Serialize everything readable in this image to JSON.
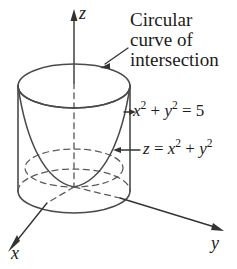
{
  "figure": {
    "type": "math-3d-diagram",
    "background_color": "#ffffff",
    "stroke_color": "#4a4a4a",
    "text_color": "#1b1b1b",
    "caption": {
      "line1": "Circular",
      "line2": "curve of",
      "line3": "intersection"
    },
    "labels": {
      "cylinder_equation": "x² + y² = 5",
      "paraboloid_equation": "z = x² + y²"
    },
    "axes": {
      "z": "z",
      "x": "x",
      "y": "y"
    },
    "surfaces": [
      {
        "name": "cylinder",
        "equation": "x² + y² = 5",
        "radius_squared": 5
      },
      {
        "name": "paraboloid",
        "equation": "z = x² + y²"
      }
    ],
    "annotation_arrows": [
      "caption-arrow",
      "cylinder-equation-arrow",
      "paraboloid-equation-arrow"
    ]
  }
}
